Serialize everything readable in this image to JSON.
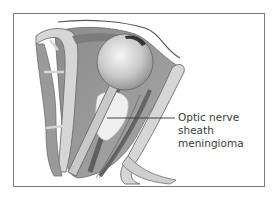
{
  "figure": {
    "type": "anatomical-illustration",
    "label": {
      "lines": [
        "Optic nerve",
        "sheath",
        "meningioma"
      ]
    },
    "colors": {
      "frame_border": "#7a7a7a",
      "bone_fill": "#d6d6d6",
      "bone_outline": "#6e6e6e",
      "tissue": "#9a9a9a",
      "dark_tissue": "#6f6f6f",
      "globe_light": "#f2f2f2",
      "globe_dark": "#9c9c9c",
      "tumor": "#eeeeee",
      "text": "#3a3a3a"
    }
  }
}
